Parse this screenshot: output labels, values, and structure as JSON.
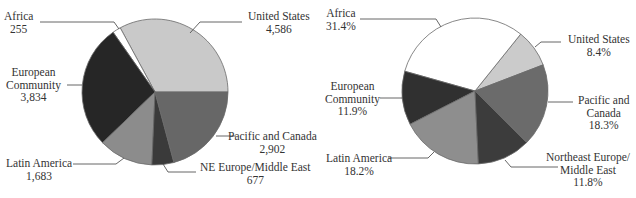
{
  "chart_data": [
    {
      "type": "pie",
      "title": "",
      "value_format": "absolute",
      "center": [
        155,
        92
      ],
      "radius": 73,
      "start_angle_deg": 0,
      "direction": "counterclockwise",
      "slices": [
        {
          "label": "United States",
          "value": 4586,
          "display": "4,586",
          "color": "#c9c9c9"
        },
        {
          "label": "Africa",
          "value": 255,
          "display": "255",
          "color": "#ffffff"
        },
        {
          "label": "European Community",
          "value": 3834,
          "display": "3,834",
          "color": "#262626"
        },
        {
          "label": "Latin America",
          "value": 1683,
          "display": "1,683",
          "color": "#8c8c8c"
        },
        {
          "label": "NE Europe/Middle East",
          "value": 677,
          "display": "677",
          "color": "#3a3a3a"
        },
        {
          "label": "Pacific and Canada",
          "value": 2902,
          "display": "2,902",
          "color": "#676767"
        }
      ]
    },
    {
      "type": "pie",
      "title": "",
      "value_format": "percent",
      "center": [
        475,
        91
      ],
      "radius": 73,
      "start_angle_deg": 21,
      "direction": "counterclockwise",
      "slices": [
        {
          "label": "United States",
          "value": 8.4,
          "display": "8.4%",
          "color": "#cbcbcb"
        },
        {
          "label": "Africa",
          "value": 31.4,
          "display": "31.4%",
          "color": "#ffffff"
        },
        {
          "label": "European Community",
          "value": 11.9,
          "display": "11.9%",
          "color": "#303030"
        },
        {
          "label": "Latin America",
          "value": 18.2,
          "display": "18.2%",
          "color": "#8e8e8e"
        },
        {
          "label": "Northeast Europe/Middle East",
          "value": 11.8,
          "display": "11.8%",
          "color": "#3c3c3c"
        },
        {
          "label": "Pacific and Canada",
          "value": 18.3,
          "display": "18.3%",
          "color": "#6b6b6b"
        }
      ]
    }
  ],
  "labels": {
    "left": {
      "africa": {
        "name": "Africa",
        "value": "255"
      },
      "us": {
        "name": "United States",
        "value": "4,586"
      },
      "ec": {
        "line1": "European",
        "line2": "Community",
        "value": "3,834"
      },
      "pacific": {
        "name": "Pacific and Canada",
        "value": "2,902"
      },
      "latin": {
        "name": "Latin America",
        "value": "1,683"
      },
      "ne": {
        "name": "NE Europe/Middle East",
        "value": "677"
      }
    },
    "right": {
      "africa": {
        "name": "Africa",
        "value": "31.4%"
      },
      "us": {
        "name": "United States",
        "value": "8.4%"
      },
      "ec": {
        "line1": "European",
        "line2": "Community",
        "value": "11.9%"
      },
      "pacific": {
        "line1": "Pacific and",
        "line2": "Canada",
        "value": "18.3%"
      },
      "latin": {
        "name": "Latin America",
        "value": "18.2%"
      },
      "ne": {
        "line1": "Northeast Europe/",
        "line2": "Middle East",
        "value": "11.8%"
      }
    }
  }
}
